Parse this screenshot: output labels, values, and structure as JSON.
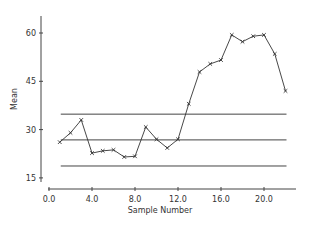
{
  "chart_data": {
    "type": "line",
    "title": "",
    "xlabel": "Sample Number",
    "ylabel": "Mean",
    "xlim": [
      0,
      23
    ],
    "ylim": [
      14,
      65
    ],
    "x_ticks": [
      0,
      4,
      8,
      12,
      16,
      20
    ],
    "x_tick_labels": [
      "0.0",
      "4.0",
      "8.0",
      "12.0",
      "16.0",
      "20.0"
    ],
    "y_ticks": [
      15,
      30,
      45,
      60
    ],
    "y_tick_labels": [
      "15",
      "30",
      "45",
      "60"
    ],
    "grid": false,
    "legend": null,
    "marker": "x",
    "x": [
      1,
      2,
      3,
      4,
      5,
      6,
      7,
      8,
      9,
      10,
      11,
      12,
      13,
      14,
      15,
      16,
      17,
      18,
      19,
      20,
      21,
      22
    ],
    "series": [
      {
        "name": "Sample Mean",
        "values": [
          26.1,
          29.0,
          33.0,
          22.7,
          23.4,
          23.7,
          21.5,
          21.7,
          30.8,
          27.0,
          24.3,
          27.0,
          38.0,
          47.9,
          50.4,
          51.6,
          59.4,
          57.3,
          59.0,
          59.4,
          53.5,
          42.0
        ]
      }
    ],
    "control_limits": {
      "upper": 34.8,
      "center": 26.8,
      "lower": 18.7,
      "x_start": 1,
      "x_end": 22
    }
  },
  "colors": {
    "line": "#333333",
    "axis": "#444444",
    "control_line": "#444444",
    "background": "#ffffff"
  },
  "labels": {
    "xlabel": "Sample Number",
    "ylabel": "Mean"
  }
}
